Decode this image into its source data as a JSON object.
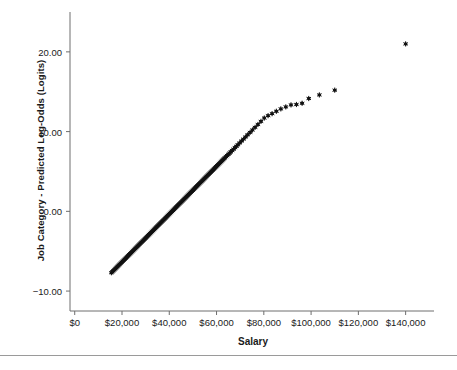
{
  "chart_data": {
    "type": "scatter",
    "title": "",
    "xlabel": "Salary",
    "ylabel": "Job Category - Predicted Log-Odds (Logits)",
    "xlim": [
      -2000,
      152000
    ],
    "ylim": [
      -12.5,
      25.0
    ],
    "grid": false,
    "legend": null,
    "marker": "star",
    "marker_color": "#111111",
    "xticks": [
      0,
      20000,
      40000,
      60000,
      80000,
      100000,
      120000,
      140000
    ],
    "xtick_labels": [
      "$0",
      "$20,000",
      "$40,000",
      "$60,000",
      "$80,000",
      "$100,000",
      "$120,000",
      "$140,000"
    ],
    "yticks": [
      -10,
      0,
      10,
      20
    ],
    "ytick_labels": [
      "−10.00",
      "0.00",
      "10.00",
      "20.00"
    ],
    "series": [
      {
        "name": "Job Category - Predicted Log-Odds",
        "points": [
          [
            15500,
            -7.7
          ],
          [
            15900,
            -7.58
          ],
          [
            16300,
            -7.46
          ],
          [
            16700,
            -7.34
          ],
          [
            17100,
            -7.22
          ],
          [
            17500,
            -7.1
          ],
          [
            17900,
            -6.98
          ],
          [
            18300,
            -6.86
          ],
          [
            18700,
            -6.74
          ],
          [
            19100,
            -6.62
          ],
          [
            19500,
            -6.5
          ],
          [
            19900,
            -6.38
          ],
          [
            20300,
            -6.26
          ],
          [
            20700,
            -6.14
          ],
          [
            21100,
            -6.02
          ],
          [
            21500,
            -5.9
          ],
          [
            21900,
            -5.78
          ],
          [
            22300,
            -5.66
          ],
          [
            22700,
            -5.54
          ],
          [
            23100,
            -5.42
          ],
          [
            23500,
            -5.3
          ],
          [
            23900,
            -5.18
          ],
          [
            24300,
            -5.06
          ],
          [
            24700,
            -4.94
          ],
          [
            25100,
            -4.82
          ],
          [
            25500,
            -4.7
          ],
          [
            25900,
            -4.58
          ],
          [
            26300,
            -4.46
          ],
          [
            26700,
            -4.34
          ],
          [
            27100,
            -4.22
          ],
          [
            27500,
            -4.1
          ],
          [
            27900,
            -3.98
          ],
          [
            28300,
            -3.86
          ],
          [
            28700,
            -3.74
          ],
          [
            29100,
            -3.62
          ],
          [
            29500,
            -3.5
          ],
          [
            29900,
            -3.38
          ],
          [
            30300,
            -3.26
          ],
          [
            30700,
            -3.14
          ],
          [
            31100,
            -3.02
          ],
          [
            31500,
            -2.9
          ],
          [
            31900,
            -2.78
          ],
          [
            32300,
            -2.66
          ],
          [
            32700,
            -2.54
          ],
          [
            33100,
            -2.42
          ],
          [
            33500,
            -2.3
          ],
          [
            33900,
            -2.18
          ],
          [
            34300,
            -2.06
          ],
          [
            34700,
            -1.94
          ],
          [
            35100,
            -1.82
          ],
          [
            35500,
            -1.7
          ],
          [
            35900,
            -1.58
          ],
          [
            36300,
            -1.46
          ],
          [
            36700,
            -1.34
          ],
          [
            37100,
            -1.22
          ],
          [
            37500,
            -1.1
          ],
          [
            37900,
            -0.98
          ],
          [
            38300,
            -0.86
          ],
          [
            38700,
            -0.74
          ],
          [
            39100,
            -0.62
          ],
          [
            39500,
            -0.5
          ],
          [
            39900,
            -0.38
          ],
          [
            40300,
            -0.26
          ],
          [
            40700,
            -0.14
          ],
          [
            41100,
            -0.02
          ],
          [
            41500,
            0.1
          ],
          [
            41900,
            0.22
          ],
          [
            42300,
            0.34
          ],
          [
            42700,
            0.46
          ],
          [
            43100,
            0.58
          ],
          [
            43500,
            0.7
          ],
          [
            43900,
            0.82
          ],
          [
            44300,
            0.94
          ],
          [
            44700,
            1.06
          ],
          [
            45100,
            1.18
          ],
          [
            45500,
            1.3
          ],
          [
            45900,
            1.42
          ],
          [
            46300,
            1.54
          ],
          [
            46700,
            1.66
          ],
          [
            47100,
            1.78
          ],
          [
            47500,
            1.9
          ],
          [
            47900,
            2.02
          ],
          [
            48300,
            2.14
          ],
          [
            48700,
            2.26
          ],
          [
            49100,
            2.38
          ],
          [
            49500,
            2.5
          ],
          [
            49900,
            2.62
          ],
          [
            50300,
            2.74
          ],
          [
            50700,
            2.86
          ],
          [
            51100,
            2.98
          ],
          [
            51500,
            3.1
          ],
          [
            51900,
            3.22
          ],
          [
            52300,
            3.34
          ],
          [
            52700,
            3.46
          ],
          [
            53100,
            3.58
          ],
          [
            53500,
            3.7
          ],
          [
            53900,
            3.82
          ],
          [
            54300,
            3.94
          ],
          [
            54700,
            4.06
          ],
          [
            55100,
            4.18
          ],
          [
            55500,
            4.3
          ],
          [
            55900,
            4.42
          ],
          [
            56300,
            4.54
          ],
          [
            56700,
            4.66
          ],
          [
            57100,
            4.78
          ],
          [
            57500,
            4.9
          ],
          [
            57900,
            5.02
          ],
          [
            58300,
            5.14
          ],
          [
            58700,
            5.26
          ],
          [
            59100,
            5.38
          ],
          [
            59500,
            5.5
          ],
          [
            59900,
            5.62
          ],
          [
            60300,
            5.74
          ],
          [
            60700,
            5.86
          ],
          [
            61100,
            5.98
          ],
          [
            61500,
            6.1
          ],
          [
            61900,
            6.22
          ],
          [
            62300,
            6.34
          ],
          [
            62700,
            6.46
          ],
          [
            63100,
            6.58
          ],
          [
            63500,
            6.7
          ],
          [
            64000,
            6.85
          ],
          [
            64500,
            7.0
          ],
          [
            65000,
            7.15
          ],
          [
            65500,
            7.3
          ],
          [
            66000,
            7.45
          ],
          [
            66600,
            7.62
          ],
          [
            67200,
            7.8
          ],
          [
            67800,
            7.98
          ],
          [
            68400,
            8.16
          ],
          [
            69000,
            8.34
          ],
          [
            69800,
            8.58
          ],
          [
            70600,
            8.82
          ],
          [
            71400,
            9.06
          ],
          [
            72300,
            9.33
          ],
          [
            73200,
            9.6
          ],
          [
            74200,
            9.9
          ],
          [
            75200,
            10.2
          ],
          [
            76300,
            10.53
          ],
          [
            77500,
            10.89
          ],
          [
            78800,
            11.28
          ],
          [
            80200,
            11.7
          ],
          [
            81800,
            12.0
          ],
          [
            83500,
            12.25
          ],
          [
            85300,
            12.55
          ],
          [
            87200,
            12.85
          ],
          [
            89300,
            13.1
          ],
          [
            91500,
            13.35
          ],
          [
            93800,
            13.4
          ],
          [
            96200,
            13.55
          ],
          [
            99000,
            14.15
          ],
          [
            103500,
            14.6
          ],
          [
            110000,
            15.2
          ],
          [
            140000,
            21.0
          ]
        ]
      }
    ]
  }
}
